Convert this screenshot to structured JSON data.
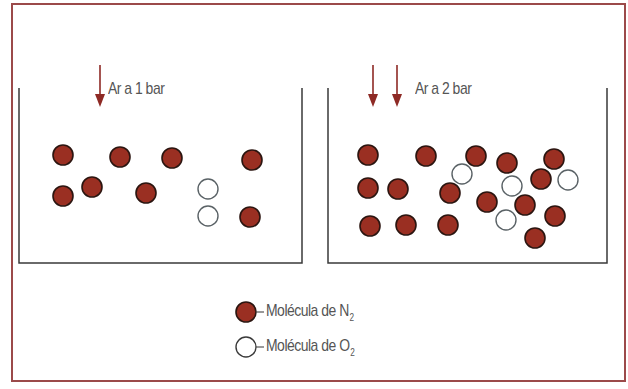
{
  "colors": {
    "frame": "#9b4a4a",
    "n2_fill": "#9a2f22",
    "n2_stroke": "#2b1510",
    "o2_fill": "#ffffff",
    "o2_stroke": "#5a6266",
    "wall": "#3a3a3a",
    "arrow": "#8e2a25",
    "text": "#555555"
  },
  "containers": [
    {
      "name": "left",
      "label": "Ar a 1 bar",
      "arrows": 1,
      "n2": [
        [
          63,
          155
        ],
        [
          120,
          157
        ],
        [
          172,
          158
        ],
        [
          252,
          160
        ],
        [
          63,
          196
        ],
        [
          92,
          187
        ],
        [
          146,
          193
        ],
        [
          250,
          217
        ]
      ],
      "o2": [
        [
          208,
          189
        ],
        [
          208,
          216
        ]
      ]
    },
    {
      "name": "right",
      "label": "Ar a 2 bar",
      "arrows": 2,
      "n2": [
        [
          368,
          155
        ],
        [
          426,
          156
        ],
        [
          476,
          156
        ],
        [
          507,
          163
        ],
        [
          554,
          159
        ],
        [
          541,
          179
        ],
        [
          368,
          188
        ],
        [
          398,
          189
        ],
        [
          450,
          193
        ],
        [
          487,
          202
        ],
        [
          525,
          205
        ],
        [
          555,
          216
        ],
        [
          370,
          226
        ],
        [
          406,
          225
        ],
        [
          448,
          225
        ],
        [
          535,
          238
        ]
      ],
      "o2": [
        [
          462,
          174
        ],
        [
          512,
          186
        ],
        [
          568,
          180
        ],
        [
          506,
          220
        ]
      ]
    }
  ],
  "legend": {
    "n2_label": "Molécula de N",
    "n2_sub": "2",
    "o2_label": "Molécula de O",
    "o2_sub": "2"
  }
}
